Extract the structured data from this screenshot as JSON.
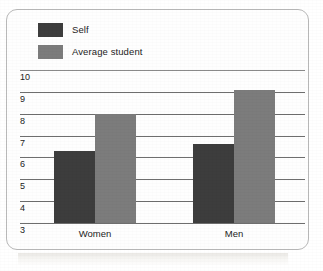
{
  "chart_data": {
    "type": "bar",
    "title": "",
    "subtitle": "",
    "xlabel": "",
    "ylabel": "",
    "categories": [
      "Women",
      "Men"
    ],
    "series": [
      {
        "name": "Self",
        "color": "#3d3d3d",
        "values": [
          6.3,
          6.6
        ]
      },
      {
        "name": "Average student",
        "color": "#7c7c7c",
        "values": [
          8.0,
          9.1
        ]
      }
    ],
    "ylim": [
      3,
      10
    ],
    "yticks": [
      10,
      9,
      8,
      7,
      6,
      5,
      4,
      3
    ],
    "ytick_labels": [
      "10",
      "9",
      "8",
      "7",
      "6",
      "5",
      "4",
      "3"
    ],
    "grid": true,
    "grid_axis": "y",
    "legend": true,
    "legend_position": "top-left",
    "bar_group_gap": true
  },
  "legend": {
    "items": [
      {
        "label": "Self",
        "swatch_color": "#3d3d3d",
        "swatch_name": "legend-swatch-self"
      },
      {
        "label": "Average student",
        "swatch_color": "#7c7c7c",
        "swatch_name": "legend-swatch-average-student"
      }
    ]
  },
  "axis": {
    "y_labels": [
      "10",
      "9",
      "8",
      "7",
      "6",
      "5",
      "4",
      "3"
    ],
    "x_labels": [
      "Women",
      "Men"
    ]
  },
  "colors": {
    "self": "#3d3d3d",
    "average_student": "#7c7c7c",
    "gridline": "#6e6e6e",
    "card_border": "#b9b9b9",
    "background": "#ffffff",
    "text": "#1d1d1d"
  }
}
